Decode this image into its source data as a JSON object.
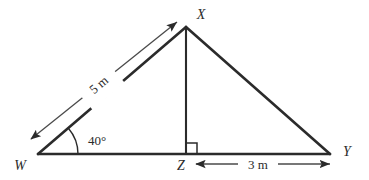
{
  "figure": {
    "background_color": "#ffffff",
    "stroke_color": "#2b2b2b",
    "labels": {
      "vertex_w": "W",
      "vertex_x": "X",
      "vertex_y": "Y",
      "vertex_z": "Z",
      "angle_w": "40°",
      "side_wx": "5 m",
      "segment_zy": "3 m"
    },
    "geometry": {
      "points": {
        "W": [
          38,
          154
        ],
        "X": [
          186,
          27
        ],
        "Y": [
          330,
          154
        ],
        "Z": [
          186,
          154
        ]
      },
      "angle_at_w_degrees": 40,
      "length_wx_m": 5,
      "length_zy_m": 3,
      "right_angle_at": "Z",
      "altitude": "XZ"
    },
    "dimension_arrows": [
      {
        "name": "wx-dimension",
        "label": "5 m",
        "from": [
          31,
          139
        ],
        "to": [
          177,
          22
        ],
        "double_headed": true
      },
      {
        "name": "zy-dimension",
        "label": "3 m",
        "from": [
          196,
          164
        ],
        "to": [
          330,
          164
        ],
        "double_headed": true
      }
    ]
  }
}
